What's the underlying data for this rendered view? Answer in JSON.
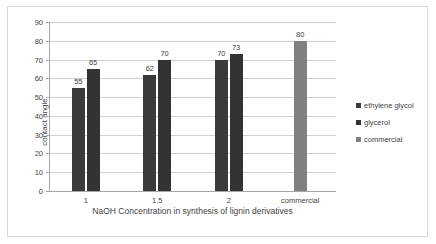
{
  "chart_data": {
    "type": "bar",
    "title": "",
    "subtitle": "",
    "xlabel": "NaOH Concentration in synthesis of lignin derivatives",
    "ylabel": "contact angle",
    "categories": [
      "1",
      "1.5",
      "2",
      "commercial"
    ],
    "ylim": [
      0,
      90
    ],
    "ytick_step": 10,
    "yticks": [
      "90",
      "80",
      "70",
      "60",
      "50",
      "40",
      "30",
      "20",
      "10",
      "0"
    ],
    "grid": true,
    "legend_position": "right",
    "series": [
      {
        "name": "ethylene glycol",
        "color": "#3a3a3a",
        "values": [
          55,
          62,
          70,
          null
        ],
        "labels": [
          "55",
          "62",
          "70",
          ""
        ]
      },
      {
        "name": "glycerol",
        "color": "#333333",
        "values": [
          65,
          70,
          73,
          null
        ],
        "labels": [
          "65",
          "70",
          "73",
          ""
        ]
      },
      {
        "name": "commercial",
        "color": "#808080",
        "values": [
          null,
          null,
          null,
          80
        ],
        "labels": [
          "",
          "",
          "",
          "80"
        ]
      }
    ]
  },
  "legend": {
    "items": [
      {
        "label": "ethylene glycol",
        "color": "#3a3a3a"
      },
      {
        "label": "glycerol",
        "color": "#333333"
      },
      {
        "label": "commercial",
        "color": "#808080"
      }
    ]
  }
}
